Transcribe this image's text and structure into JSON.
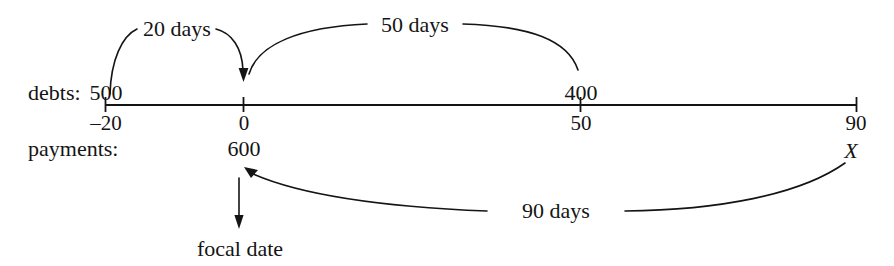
{
  "diagram": {
    "type": "focal-date-timeline",
    "row_labels": {
      "debts": "debts:",
      "payments": "payments:"
    },
    "axis": {
      "start_value": -20,
      "end_value": 90,
      "tick_labels": [
        "–20",
        "0",
        "50",
        "90"
      ],
      "tick_values": [
        -20,
        0,
        50,
        90
      ]
    },
    "debts": [
      {
        "amount": "500",
        "at": "–20"
      },
      {
        "amount": "400",
        "at": "50"
      }
    ],
    "payments": [
      {
        "amount": "600",
        "at": "0"
      },
      {
        "amount": "X",
        "at": "90"
      }
    ],
    "arrows": [
      {
        "label": "20 days",
        "from": "–20",
        "to": "0",
        "side": "above"
      },
      {
        "label": "50 days",
        "from": "50",
        "to": "0",
        "side": "above"
      },
      {
        "label": "90 days",
        "from": "90",
        "to": "0",
        "side": "below"
      }
    ],
    "focal_date_label": "focal date",
    "colors": {
      "ink": "#141414",
      "background": "#ffffff"
    }
  }
}
